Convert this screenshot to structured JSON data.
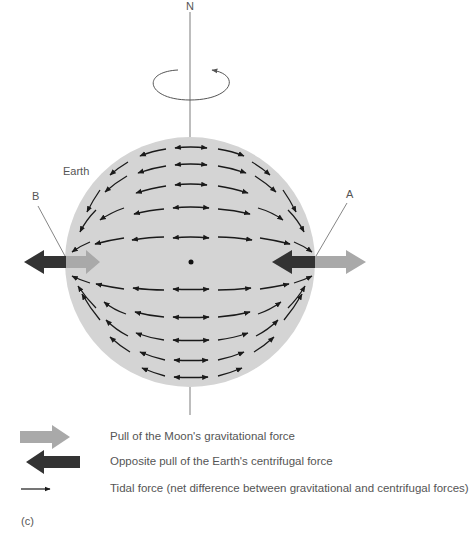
{
  "labels": {
    "north": "N",
    "earth": "Earth",
    "point_a": "A",
    "point_b": "B",
    "panel": "(c)"
  },
  "colors": {
    "earth_fill": "#d4d4d4",
    "moon_gravity_arrow": "#a9a9a9",
    "centrifugal_arrow": "#333333",
    "tidal_arrow": "#1a1a1a",
    "axis_line": "#9a9a9a"
  },
  "legend": [
    {
      "icon": "light-gray-right-arrow-icon",
      "text": "Pull of the Moon's gravitational force"
    },
    {
      "icon": "dark-left-arrow-icon",
      "text": "Opposite pull of the Earth's centrifugal force"
    },
    {
      "icon": "thin-right-arrow-icon",
      "text": "Tidal force (net difference between gravitational and centrifugal forces)"
    }
  ]
}
